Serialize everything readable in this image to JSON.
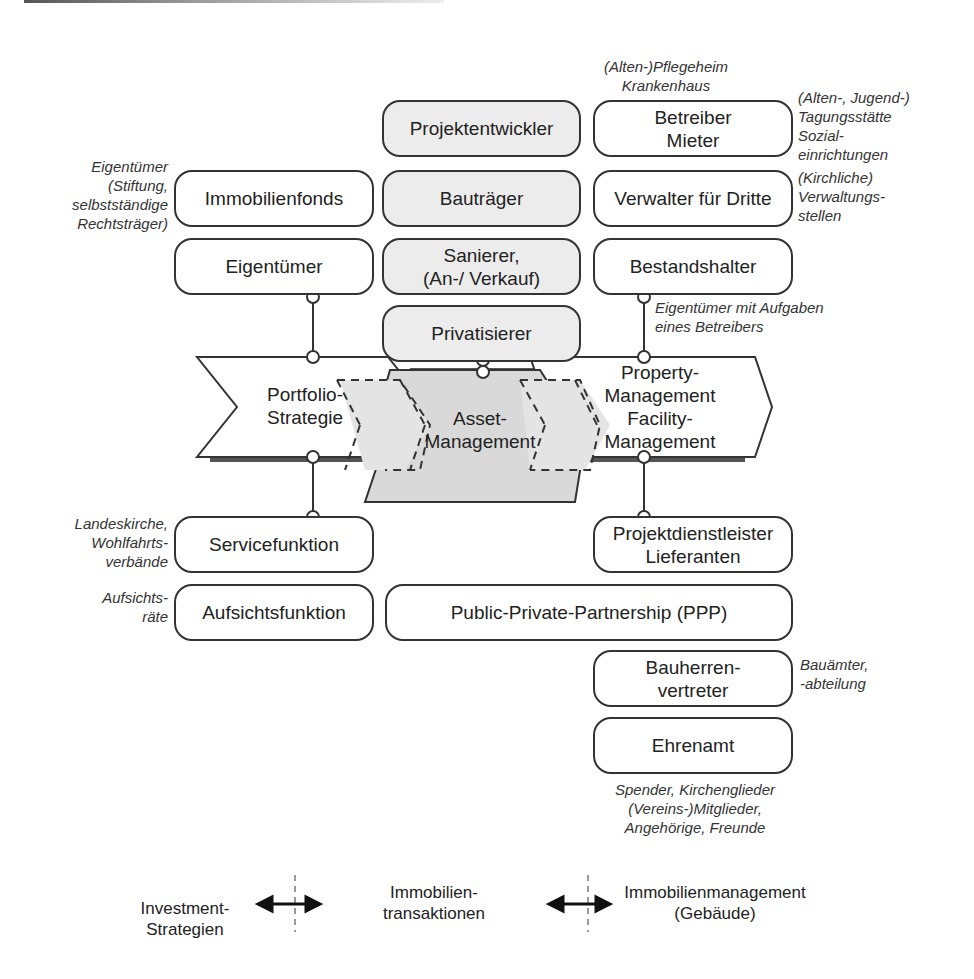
{
  "diagram": {
    "boxes": {
      "projektentwickler": "Projektentwickler",
      "betreiber_mieter": "Betreiber\nMieter",
      "immobilienfonds": "Immobilienfonds",
      "bautraeger": "Bauträger",
      "verwalter": "Verwalter für Dritte",
      "eigentuemer": "Eigentümer",
      "sanierer": "Sanierer,\n(An-/ Verkauf)",
      "bestandshalter": "Bestandshalter",
      "privatisierer": "Privatisierer",
      "servicefunktion": "Servicefunktion",
      "projektdienstleister": "Projektdienstleister\nLieferanten",
      "aufsichtsfunktion": "Aufsichtsfunktion",
      "ppp": "Public-Private-Partnership (PPP)",
      "bauherrenvertreter": "Bauherren-\nvertreter",
      "ehrenamt": "Ehrenamt"
    },
    "chevrons": {
      "portfolio": "Portfolio-\nStrategie",
      "asset": "Asset-\nManagement",
      "property": "Property-\nManagement\nFacility-\nManagement"
    },
    "notes": {
      "pflegeheim": "(Alten-)Pflegeheim\nKrankenhaus",
      "tagungsstaette": "(Alten-, Jugend-)\nTagungsstätte\nSozial-\neinrichtungen",
      "eigentuemer_stiftung": "Eigentümer\n(Stiftung,\nselbstständige\nRechtsträger)",
      "kirchliche": "(Kirchliche)\nVerwaltungs-\nstellen",
      "eigentuemer_aufgaben": "Eigentümer mit Aufgaben\neines Betreibers",
      "landeskirche": "Landeskirche,\nWohlfahrts-\nverbände",
      "aufsichtsraete": "Aufsichts-\nräte",
      "bauaemter": "Bauämter,\n-abteilung",
      "spender": "Spender, Kirchenglieder\n(Vereins-)Mitglieder,\nAngehörige, Freunde"
    },
    "bottom_axis": {
      "investment": "Investment-Strategien",
      "transaktionen": "Immobilien-\ntransaktionen",
      "management": "Immobilienmanagement\n(Gebäude)"
    },
    "colors": {
      "stroke": "#333333",
      "shaded_fill": "#ececec",
      "asset_fill": "#d9d9d9",
      "shadow": "#555555"
    }
  }
}
